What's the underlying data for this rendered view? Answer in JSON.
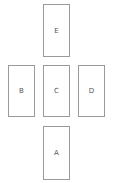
{
  "cards": {
    "top": {
      "label": "E"
    },
    "left": {
      "label": "B"
    },
    "center": {
      "label": "C"
    },
    "right": {
      "label": "D"
    },
    "bottom": {
      "label": "A"
    }
  },
  "colors": {
    "border": "#9a9a9a",
    "text": "#555555",
    "background": "#ffffff"
  }
}
